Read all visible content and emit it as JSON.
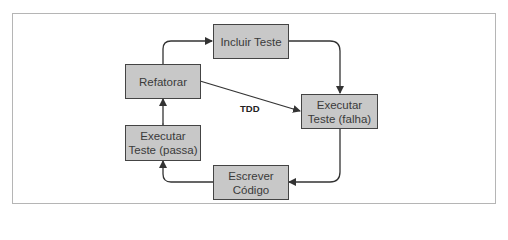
{
  "diagram": {
    "title": "TDD",
    "nodes": [
      {
        "id": "incluir",
        "lines": [
          "Incluir Teste"
        ]
      },
      {
        "id": "refatorar",
        "lines": [
          "Refatorar"
        ]
      },
      {
        "id": "falha",
        "lines": [
          "Executar",
          "Teste (falha)"
        ]
      },
      {
        "id": "passa",
        "lines": [
          "Executar",
          "Teste (passa)"
        ]
      },
      {
        "id": "escrever",
        "lines": [
          "Escrever",
          "Código"
        ]
      }
    ],
    "edges": [
      {
        "from": "refatorar",
        "to": "incluir"
      },
      {
        "from": "incluir",
        "to": "falha"
      },
      {
        "from": "falha",
        "to": "escrever"
      },
      {
        "from": "escrever",
        "to": "passa"
      },
      {
        "from": "passa",
        "to": "refatorar",
        "bidirectional": true
      },
      {
        "from": "refatorar",
        "to": "falha",
        "label": "TDD"
      }
    ],
    "colors": {
      "node_fill": "#c8c8c8",
      "node_border": "#444444",
      "edge": "#333333",
      "frame": "#b5b5b5"
    }
  }
}
